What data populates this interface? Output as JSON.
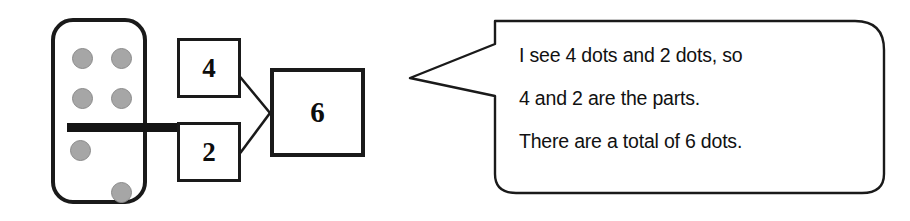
{
  "diagram": {
    "colors": {
      "background": "#ffffff",
      "outline": "#1a1a1a",
      "pip_fill": "#a6a6a6",
      "pip_stroke": "#8a8a8a",
      "text": "#111111"
    }
  },
  "domino": {
    "name": "domino-tile",
    "top_half_pips": 4,
    "bottom_half_pips": 2,
    "total_pips": 6,
    "pip_positions_top": [
      "top-left",
      "top-right",
      "middle-left",
      "middle-right"
    ],
    "pip_positions_bottom": [
      "upper-left",
      "lower-right"
    ]
  },
  "number_bond": {
    "part_a": "4",
    "part_b": "2",
    "total": "6"
  },
  "speech_bubble": {
    "lines": [
      "I see 4 dots and 2 dots, so",
      "4 and 2 are the parts.",
      "There are a total of 6 dots."
    ],
    "line_1": "I see 4 dots and 2 dots, so",
    "line_2": "4 and 2 are the parts.",
    "line_3": "There are a total of 6 dots.",
    "tail_direction": "left"
  }
}
